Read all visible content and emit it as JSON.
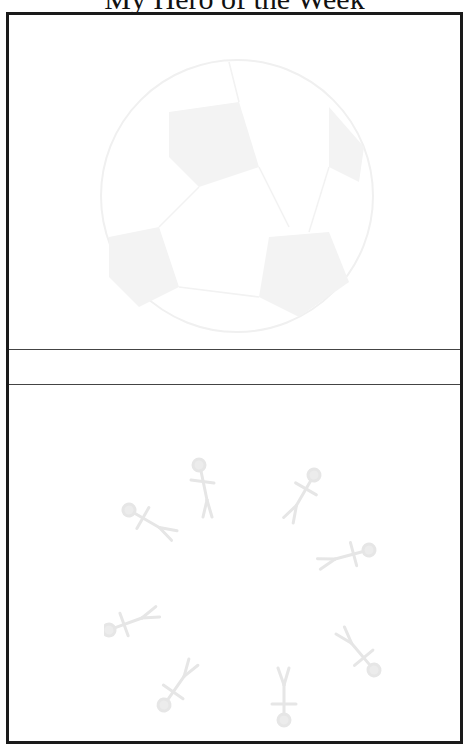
{
  "page": {
    "title": "My Hero of the Week"
  },
  "sections": {
    "top_image": "soccer-ball-watermark",
    "name_line": "",
    "bottom_image": "circle-of-people-watermark"
  },
  "colors": {
    "border": "#1a1a1a",
    "watermark": "#f2f2f2"
  }
}
